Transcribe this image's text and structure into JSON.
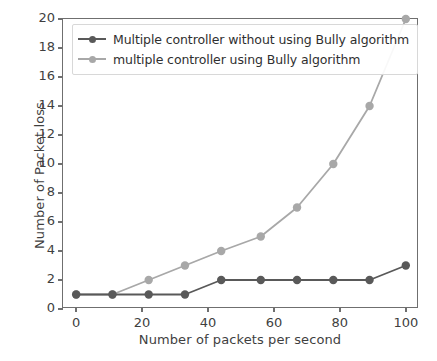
{
  "chart_data": {
    "type": "line",
    "title": "",
    "xlabel": "Number of packets per second",
    "ylabel": "Number of Packet loss",
    "xlim": [
      -4,
      104
    ],
    "ylim": [
      0,
      20
    ],
    "xticks": [
      0,
      20,
      40,
      60,
      80,
      100
    ],
    "yticks": [
      0,
      2,
      4,
      6,
      8,
      10,
      12,
      14,
      16,
      18,
      20
    ],
    "grid": false,
    "legend_position": "upper left",
    "x": [
      0,
      11,
      22,
      33,
      44,
      56,
      67,
      78,
      89,
      100
    ],
    "series": [
      {
        "name": "Multiple controller without using Bully algorithm",
        "color": "#595959",
        "marker": "circle",
        "values": [
          1,
          1,
          1,
          1,
          2,
          2,
          2,
          2,
          2,
          3
        ]
      },
      {
        "name": "multiple controller using Bully algorithm",
        "color": "#a8a8a8",
        "marker": "circle",
        "values": [
          1,
          1,
          2,
          3,
          4,
          5,
          7,
          10,
          14,
          20
        ]
      }
    ]
  },
  "axes": {
    "frame_color": "#6f6f6f",
    "tick_label_color": "#3f3f3f"
  },
  "legend": {
    "entries": [
      {
        "label": "Multiple controller without using Bully algorithm",
        "color": "#595959"
      },
      {
        "label": "multiple controller using Bully algorithm",
        "color": "#a8a8a8"
      }
    ]
  }
}
